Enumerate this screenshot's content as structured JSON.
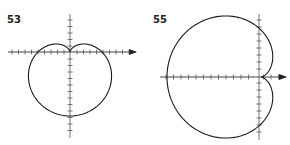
{
  "figures": [
    {
      "label": "53",
      "curve": "cardioid, cusp at origin pointing up, extends downward"
    },
    {
      "label": "55",
      "curve": "cardioid, cusp at origin pointing right, extends leftward"
    }
  ],
  "colors": {
    "stroke": "#1a1a1a",
    "axis": "#555555"
  }
}
